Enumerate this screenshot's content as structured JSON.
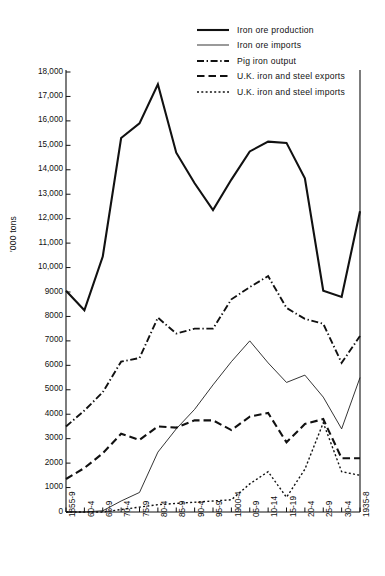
{
  "chart_data": {
    "type": "line",
    "title": "",
    "xlabel": "",
    "ylabel": "'000 tons",
    "ylim": [
      0,
      18000
    ],
    "ytick_labels": [
      "0",
      "1000",
      "2000",
      "3000",
      "4000",
      "5000",
      "6000",
      "7000",
      "8000",
      "9000",
      "10,000",
      "11,000",
      "12,000",
      "13,000",
      "14,000",
      "15,000",
      "16,000",
      "17,000",
      "18,000"
    ],
    "ytick_values": [
      0,
      1000,
      2000,
      3000,
      4000,
      5000,
      6000,
      7000,
      8000,
      9000,
      10000,
      11000,
      12000,
      13000,
      14000,
      15000,
      16000,
      17000,
      18000
    ],
    "grid": false,
    "legend_position": "top-right",
    "categories": [
      "1855-9",
      "60-4",
      "65-9",
      "70-4",
      "75-9",
      "80-4",
      "85-9",
      "90-4",
      "95-9",
      "1900-4",
      "05-9",
      "10-14",
      "15-19",
      "20-4",
      "25-9",
      "30-4",
      "1935-8"
    ],
    "series": [
      {
        "name": "Iron ore production",
        "style": "solid-thick",
        "values": [
          9050,
          8250,
          10450,
          15300,
          15900,
          17500,
          14700,
          13450,
          12350,
          13600,
          14750,
          15150,
          15100,
          13650,
          9050,
          8800,
          12300
        ]
      },
      {
        "name": "Iron ore imports",
        "style": "solid-thin",
        "values": [
          0,
          0,
          50,
          450,
          800,
          2450,
          3400,
          4200,
          5200,
          6150,
          7000,
          6100,
          5300,
          5600,
          4700,
          3400,
          5500
        ]
      },
      {
        "name": "Pig iron output",
        "style": "dash-dot",
        "values": [
          3500,
          4150,
          4900,
          6150,
          6300,
          7950,
          7300,
          7500,
          7500,
          8700,
          9200,
          9650,
          8350,
          7900,
          7700,
          6100,
          7200
        ]
      },
      {
        "name": "U.K. iron and steel exports",
        "style": "dashed",
        "values": [
          1350,
          1800,
          2400,
          3200,
          2950,
          3500,
          3450,
          3750,
          3750,
          3350,
          3900,
          4050,
          2850,
          3600,
          3800,
          2200,
          2200
        ]
      },
      {
        "name": "U.K. iron and steel imports",
        "style": "dotted",
        "values": [
          0,
          0,
          0,
          100,
          200,
          300,
          350,
          400,
          450,
          500,
          1150,
          1650,
          600,
          1750,
          3650,
          1650,
          1500
        ]
      }
    ]
  },
  "legend": {
    "items": [
      {
        "label": "Iron ore production",
        "style": "solid-thick"
      },
      {
        "label": "Iron ore imports",
        "style": "solid-thin"
      },
      {
        "label": "Pig iron output",
        "style": "dash-dot"
      },
      {
        "label": "U.K. iron and steel exports",
        "style": "dashed"
      },
      {
        "label": "U.K. iron and steel imports",
        "style": "dotted"
      }
    ]
  },
  "caption": {
    "text": ""
  },
  "colors": {
    "ink": "#111111",
    "background": "#ffffff"
  }
}
